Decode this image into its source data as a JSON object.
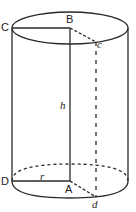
{
  "figure": {
    "stroke_color": "#2a2a2a",
    "background": "#ffffff"
  },
  "labels": {
    "C": "C",
    "B": "B",
    "c": "c",
    "h": "h",
    "D": "D",
    "r": "r",
    "A": "A",
    "d": "d"
  },
  "elements": {
    "top_ellipse": {
      "cx": 70,
      "cy": 28,
      "rx": 58,
      "ry": 16,
      "style": "solid"
    },
    "bottom_ellipse_front": {
      "style": "solid"
    },
    "bottom_ellipse_back": {
      "style": "dashed"
    },
    "segments": [
      {
        "name": "CB",
        "from": "C",
        "to": "B",
        "style": "solid"
      },
      {
        "name": "Bc",
        "from": "B",
        "to": "c",
        "style": "dashed"
      },
      {
        "name": "BA",
        "from": "B",
        "to": "A",
        "style": "solid",
        "label": "h"
      },
      {
        "name": "DA",
        "from": "D",
        "to": "A",
        "style": "solid",
        "label": "r"
      },
      {
        "name": "Ad",
        "from": "A",
        "to": "d",
        "style": "dashed"
      },
      {
        "name": "cd",
        "from": "c",
        "to": "d",
        "style": "dashed"
      }
    ]
  }
}
